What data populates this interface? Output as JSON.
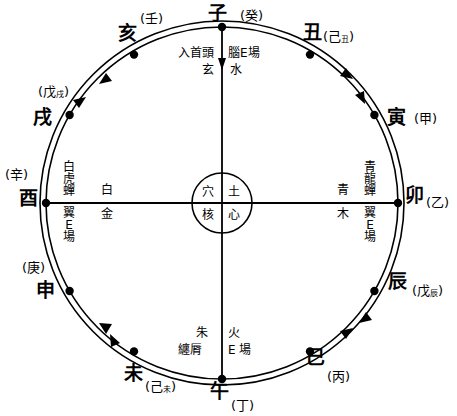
{
  "diagram": {
    "type": "radial-compass",
    "geometry": {
      "center_x": 222,
      "center_y": 203,
      "outer_radius": 182,
      "inner_radius": 176,
      "core_radius": 30
    },
    "colors": {
      "line": "#000000",
      "background": "#ffffff",
      "marker": "#000000"
    }
  },
  "core": {
    "top_left": "穴",
    "top_right": "土",
    "bottom_left": "核",
    "bottom_right": "心"
  },
  "quadrant_labels": {
    "north_left": {
      "vertical": "入首頭",
      "under": "玄"
    },
    "north_right": {
      "vertical": "腦E場",
      "under": "水"
    },
    "west_upper": "白虎蟬",
    "west_lower": "翼E場",
    "west_inner_upper": "白",
    "west_inner_lower": "金",
    "east_upper": "青龍蟬",
    "east_lower": "翼E場",
    "east_inner_upper": "青",
    "east_inner_lower": "木",
    "south_left_top": "朱",
    "south_left_bottom": "纏脣",
    "south_right_top": "火",
    "south_right_bottom": "E 場"
  },
  "branches": [
    {
      "id": "zi",
      "branch": "子",
      "stem": "癸",
      "stem_sub": "",
      "angle_deg": 90,
      "note": "north"
    },
    {
      "id": "chou",
      "branch": "丑",
      "stem": "己",
      "stem_sub": "丑",
      "angle_deg": 60,
      "note": "north-northeast"
    },
    {
      "id": "yin",
      "branch": "寅",
      "stem": "甲",
      "stem_sub": "",
      "angle_deg": 30,
      "note": "east-northeast"
    },
    {
      "id": "mao",
      "branch": "卯",
      "stem": "乙",
      "stem_sub": "",
      "angle_deg": 0,
      "note": "east"
    },
    {
      "id": "chen",
      "branch": "辰",
      "stem": "戊",
      "stem_sub": "辰",
      "angle_deg": -30,
      "note": "east-southeast"
    },
    {
      "id": "si",
      "branch": "巳",
      "stem": "丙",
      "stem_sub": "",
      "angle_deg": -60,
      "note": "south-southeast"
    },
    {
      "id": "wu",
      "branch": "午",
      "stem": "丁",
      "stem_sub": "",
      "angle_deg": -90,
      "note": "south"
    },
    {
      "id": "wei",
      "branch": "未",
      "stem": "己",
      "stem_sub": "未",
      "angle_deg": -120,
      "note": "south-southwest"
    },
    {
      "id": "shen",
      "branch": "申",
      "stem": "庚",
      "stem_sub": "",
      "angle_deg": -150,
      "note": "west-southwest"
    },
    {
      "id": "you",
      "branch": "酉",
      "stem": "辛",
      "stem_sub": "",
      "angle_deg": 180,
      "note": "west"
    },
    {
      "id": "xu",
      "branch": "戌",
      "stem": "戊",
      "stem_sub": "戌",
      "angle_deg": 150,
      "note": "west-northwest"
    },
    {
      "id": "hai",
      "branch": "亥",
      "stem": "壬",
      "stem_sub": "",
      "angle_deg": 120,
      "note": "north-northwest"
    }
  ]
}
